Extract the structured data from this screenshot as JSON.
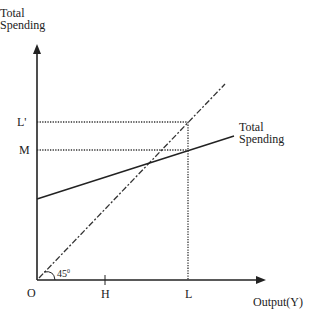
{
  "diagram": {
    "y_axis_label_line1": "Total",
    "y_axis_label_line2": "Spending",
    "x_axis_label": "Output(Y)",
    "origin_label": "O",
    "x_ticks": [
      "H",
      "L"
    ],
    "y_ticks": [
      "L'",
      "M"
    ],
    "line_label_line1": "Total",
    "line_label_line2": "Spending",
    "angle_label": "45",
    "angle_degree": "0"
  }
}
